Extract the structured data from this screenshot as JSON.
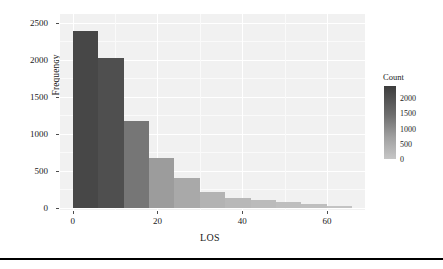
{
  "chart_data": {
    "type": "bar",
    "title": "",
    "subtitle": "",
    "xlabel": "LOS",
    "ylabel": "Frequency",
    "xlim": [
      -3,
      69
    ],
    "ylim": [
      0,
      2620
    ],
    "grid": true,
    "bin_width": 6,
    "bin_starts": [
      0,
      6,
      12,
      18,
      24,
      30,
      36,
      42,
      48,
      54,
      60
    ],
    "categories": [
      "0-6",
      "6-12",
      "12-18",
      "18-24",
      "24-30",
      "30-36",
      "36-42",
      "42-48",
      "48-54",
      "54-60",
      "60-66"
    ],
    "values": [
      2390,
      2030,
      1180,
      670,
      400,
      215,
      140,
      105,
      75,
      60,
      25
    ],
    "xticks": [
      0,
      20,
      40,
      60
    ],
    "xtick_labels": [
      "0",
      "20",
      "40",
      "60"
    ],
    "yticks": [
      0,
      500,
      1000,
      1500,
      2000,
      2500
    ],
    "ytick_labels": [
      "0",
      "500",
      "1000",
      "1500",
      "2000",
      "2500"
    ],
    "bar_colors": [
      "#474747",
      "#4f4f4f",
      "#767676",
      "#9c9c9c",
      "#a9a9a9",
      "#b3b3b3",
      "#b8b8b8",
      "#bbbbbb",
      "#bebebe",
      "#bfbfbf",
      "#c3c3c3"
    ],
    "panel_background": "#f1f1f1",
    "grid_color": "#ffffff",
    "legend": {
      "position": "right",
      "title": "Count",
      "ticks": [
        2000,
        1500,
        1000,
        500,
        0
      ],
      "tick_labels": [
        "2000",
        "1500",
        "1000",
        "500",
        "0"
      ],
      "gradient_high_color": "#3d3d3d",
      "gradient_low_color": "#c6c6c6",
      "scale_min": 0,
      "scale_max": 2400
    }
  }
}
